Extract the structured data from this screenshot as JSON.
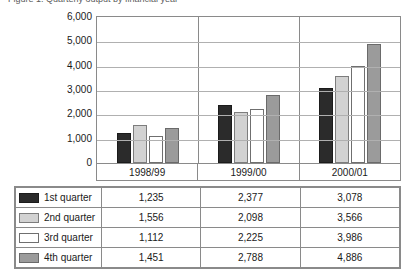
{
  "title_sliver": "Figure 1: Quarterly output by financial year",
  "chart_data": {
    "type": "bar",
    "title": "",
    "xlabel": "",
    "ylabel": "",
    "categories": [
      "1998/99",
      "1999/00",
      "2000/01"
    ],
    "series": [
      {
        "name": "1st quarter",
        "color": "#2b2b2b",
        "values": [
          1235,
          2377,
          3078
        ]
      },
      {
        "name": "2nd quarter",
        "color": "#d2d2d2",
        "values": [
          1556,
          2098,
          3566
        ]
      },
      {
        "name": "3rd quarter",
        "color": "#ffffff",
        "values": [
          1112,
          2225,
          3986
        ]
      },
      {
        "name": "4th quarter",
        "color": "#9b9b9b",
        "values": [
          1451,
          2788,
          4886
        ]
      }
    ],
    "ylim": [
      0,
      6000
    ],
    "yticks": [
      6000,
      5000,
      4000,
      3000,
      2000,
      1000,
      0
    ],
    "ytick_labels": [
      "6,000",
      "5,000",
      "4,000",
      "3,000",
      "2,000",
      "1,000",
      "0"
    ],
    "grid": true,
    "legend_position": "table-below"
  },
  "table": {
    "columns": [
      "",
      "1998/99",
      "1999/00",
      "2000/01"
    ],
    "rows": [
      {
        "label": "1st quarter",
        "swatch": "q1",
        "values": [
          "1,235",
          "2,377",
          "3,078"
        ]
      },
      {
        "label": "2nd quarter",
        "swatch": "q2",
        "values": [
          "1,556",
          "2,098",
          "3,566"
        ]
      },
      {
        "label": "3rd quarter",
        "swatch": "q3",
        "values": [
          "1,112",
          "2,225",
          "3,986"
        ]
      },
      {
        "label": "4th quarter",
        "swatch": "q4",
        "values": [
          "1,451",
          "2,788",
          "4,886"
        ]
      }
    ]
  }
}
